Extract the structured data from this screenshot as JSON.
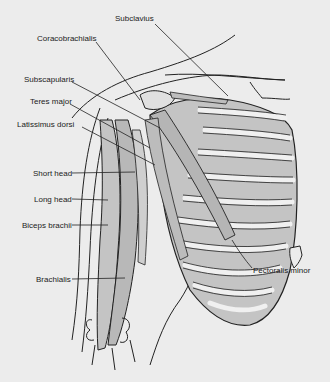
{
  "figure": {
    "background": "#ececec",
    "muscle_fill": "#c4c4c4",
    "line_color": "#222222"
  },
  "labels": [
    {
      "id": "subclavius",
      "text": "Subclavius",
      "x": 115,
      "y": 18
    },
    {
      "id": "coracobrachialis",
      "text": "Coracobrachialis",
      "x": 37,
      "y": 37
    },
    {
      "id": "subscapularis",
      "text": "Subscapularis",
      "x": 24,
      "y": 78
    },
    {
      "id": "teres-major",
      "text": "Teres major",
      "x": 30,
      "y": 100
    },
    {
      "id": "latissimus-dorsi",
      "text": "Latissimus dorsi",
      "x": 17,
      "y": 123
    },
    {
      "id": "short-head",
      "text": "Short head",
      "x": 33,
      "y": 168
    },
    {
      "id": "long-head",
      "text": "Long head",
      "x": 34,
      "y": 194
    },
    {
      "id": "biceps-brachii",
      "text": "Biceps brachii",
      "x": 22,
      "y": 220
    },
    {
      "id": "brachialis",
      "text": "Brachialis",
      "x": 36,
      "y": 274
    },
    {
      "id": "pectoralis-minor",
      "text": "Pectoralis minor",
      "x": 253,
      "y": 266
    }
  ]
}
